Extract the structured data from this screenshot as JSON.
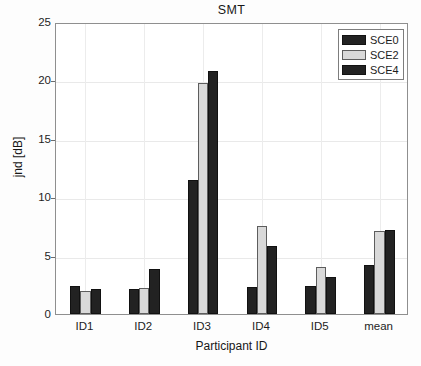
{
  "chart_data": {
    "type": "bar",
    "title": "SMT",
    "xlabel": "Participant ID",
    "ylabel": "jnd [dB]",
    "categories": [
      "ID1",
      "ID2",
      "ID3",
      "ID4",
      "ID5",
      "mean"
    ],
    "series": [
      {
        "name": "SCE0",
        "color": "#222222",
        "values": [
          2.4,
          2.1,
          11.5,
          2.3,
          2.4,
          4.2
        ]
      },
      {
        "name": "SCE2",
        "color": "#d9d9d9",
        "values": [
          2.0,
          2.2,
          19.8,
          7.5,
          4.0,
          7.15
        ]
      },
      {
        "name": "SCE4",
        "color": "#222222",
        "values": [
          2.15,
          3.85,
          20.8,
          5.8,
          3.2,
          7.2
        ]
      }
    ],
    "ylim": [
      0,
      25
    ],
    "yticks": [
      0,
      5,
      10,
      15,
      20,
      25
    ],
    "ytick_labels": [
      "0",
      "5",
      "10",
      "15",
      "20",
      "25"
    ],
    "grid": true,
    "grid_axis": "both",
    "legend_position": "top-right",
    "legend_entries": [
      "SCE0",
      "SCE2",
      "SCE4"
    ]
  }
}
